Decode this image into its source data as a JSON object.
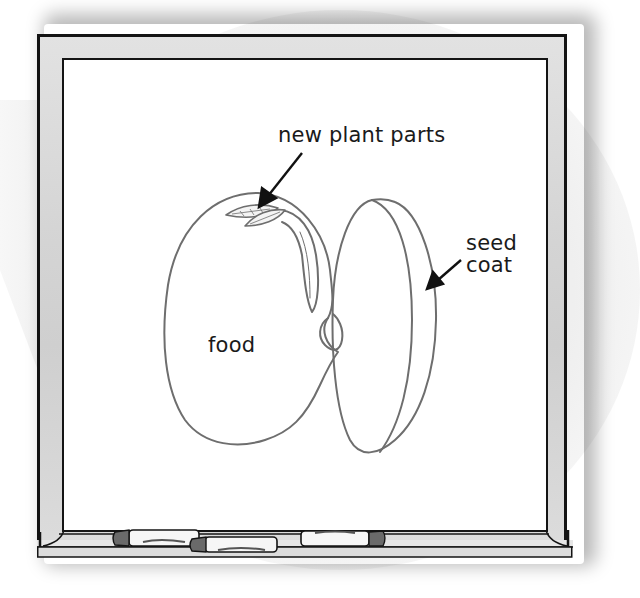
{
  "figure": {
    "setting": "whiteboard"
  },
  "labels": {
    "new_plant_parts": "new plant parts",
    "seed_coat_line1": "seed",
    "seed_coat_line2": "coat",
    "food": "food"
  },
  "colors": {
    "outline": "#6e6e6e",
    "text": "#1a1a1a",
    "frame": "#d6d6d6",
    "frame_border": "#141414",
    "board": "#ffffff",
    "marker_cap": "#6a6a6a"
  },
  "markers": [
    {
      "name": "marker-1"
    },
    {
      "name": "marker-2"
    },
    {
      "name": "marker-3"
    }
  ]
}
